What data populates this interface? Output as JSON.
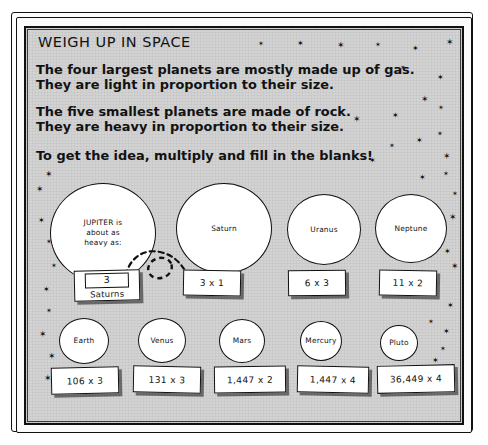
{
  "poster": {
    "title": "WEIGH UP IN SPACE",
    "paragraphs": [
      {
        "line1": "The four largest planets are mostly made up of gas.",
        "line2": "They are light in proportion to their size."
      },
      {
        "line1": "The five smallest planets are made of rock.",
        "line2": "They are heavy in proportion to their size."
      },
      {
        "line1": "To get the idea, multiply and fill in the blanks!",
        "line2": ""
      }
    ],
    "background_color": "#d3d3d3",
    "ink_color": "#111111"
  },
  "gas_giants": {
    "jupiter": {
      "label_line1": "JUPITER is",
      "label_line2": "about as",
      "label_line3": "heavy as:",
      "answer_value": "3",
      "answer_caption": "Saturns"
    },
    "planets": [
      {
        "name": "Saturn",
        "answer": "3 x 1"
      },
      {
        "name": "Uranus",
        "answer": "6 x 3"
      },
      {
        "name": "Neptune",
        "answer": "11 x 2"
      }
    ]
  },
  "rocky_planets": [
    {
      "name": "Earth",
      "answer": "106 x 3"
    },
    {
      "name": "Venus",
      "answer": "131 x 3"
    },
    {
      "name": "Mars",
      "answer": "1,447 x 2"
    },
    {
      "name": "Mercury",
      "answer": "1,447 x 4"
    },
    {
      "name": "Pluto",
      "answer": "36,449 x 4"
    }
  ],
  "decoration": {
    "star_glyph": "✶",
    "star_count": 39
  }
}
